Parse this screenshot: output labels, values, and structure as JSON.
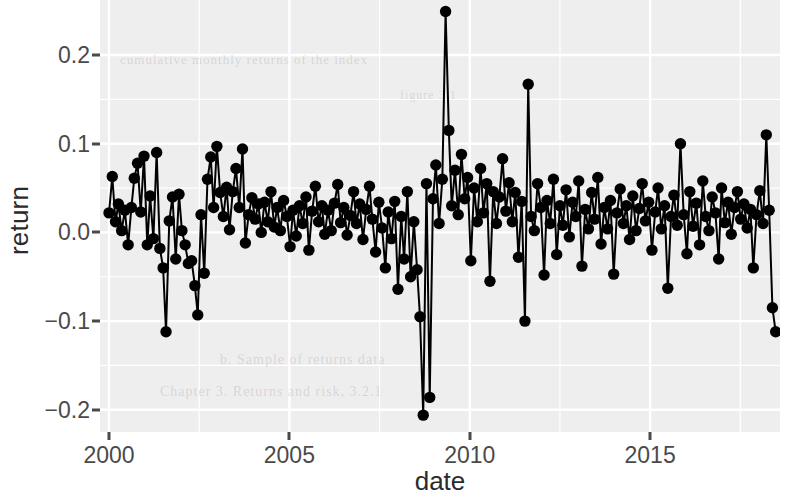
{
  "figure": {
    "background_color": "#ffffff",
    "panel_color": "#eeeeee",
    "grid_color": "#ffffff",
    "series_color": "#000000",
    "axis_text_color": "#4a4a4a",
    "axis_title_color": "#2b2b2b"
  },
  "ghost_text": [
    {
      "text": "cumulative monthly returns of the index",
      "x": 20,
      "y": 52,
      "size": 13
    },
    {
      "text": "figure 3.1",
      "x": 300,
      "y": 88,
      "size": 12
    },
    {
      "text": "b. Sample of returns data",
      "x": 120,
      "y": 352,
      "size": 14
    },
    {
      "text": "Chapter 3.  Returns and risk, 3.2.1",
      "x": 60,
      "y": 384,
      "size": 14
    }
  ],
  "chart_data": {
    "type": "line",
    "title": "",
    "subtitle": "",
    "xlabel": "date",
    "ylabel": "return",
    "grid": true,
    "legend": null,
    "markers": true,
    "marker_size": 7,
    "xlim": [
      1999.75,
      2018.6
    ],
    "ylim": [
      -0.225,
      0.262
    ],
    "xticks": [
      2000,
      2005,
      2010,
      2015
    ],
    "xticklabels": [
      "2000",
      "2005",
      "2010",
      "2015"
    ],
    "xticks_minor": [
      2002.5,
      2007.5,
      2012.5,
      2017.5
    ],
    "yticks": [
      -0.2,
      -0.1,
      0.0,
      0.1,
      0.2
    ],
    "yticklabels": [
      "-0.2",
      "-0.1",
      "0.0",
      "0.1",
      "0.2"
    ],
    "yticks_minor": [
      -0.15,
      -0.05,
      0.05,
      0.15
    ],
    "x": [
      2000.0,
      2000.33,
      2000.67,
      2001.0,
      2001.33,
      2001.67,
      2002.0,
      2002.33,
      2002.67,
      2003.0,
      2003.33,
      2003.67,
      2004.0,
      2004.33,
      2004.67,
      2005.0,
      2005.33,
      2005.67,
      2006.0,
      2006.33,
      2006.67,
      2007.0,
      2007.33,
      2007.67,
      2008.0,
      2008.33,
      2008.67,
      2009.0,
      2009.33,
      2009.67,
      2010.0,
      2010.33,
      2010.67,
      2011.0,
      2011.33,
      2011.67,
      2012.0,
      2012.33,
      2012.67,
      2013.0,
      2013.33,
      2013.67,
      2014.0,
      2014.33,
      2014.67,
      2015.0,
      2015.33,
      2015.67,
      2016.0,
      2016.33,
      2016.67,
      2017.0,
      2017.33,
      2017.67,
      2018.0,
      2018.33
    ],
    "x_full": [
      2000.0,
      2000.083,
      2000.167,
      2000.25,
      2000.333,
      2000.417,
      2000.5,
      2000.583,
      2000.667,
      2000.75,
      2000.833,
      2000.917
    ],
    "values": [
      0.022,
      0.063,
      0.012,
      0.028,
      0.002,
      0.078,
      0.086,
      0.041,
      -0.007,
      -0.018,
      -0.112,
      0.013,
      0.04,
      0.085,
      0.028,
      -0.028,
      -0.063,
      -0.002,
      -0.064,
      -0.093,
      0.003,
      0.046,
      0.094,
      0.063,
      0.018,
      0.035,
      0.096,
      0.047,
      0.012,
      0.039,
      -0.001,
      0.023,
      0.048,
      0.013,
      0.032,
      0.004,
      0.035,
      0.018,
      0.028,
      0.037,
      0.012,
      -0.047,
      0.058,
      0.002,
      0.027,
      0.013,
      0.03,
      -0.024,
      0.046,
      0.007,
      0.022,
      -0.04,
      0.047,
      0.025,
      0.074,
      0.005
    ],
    "series": [
      {
        "name": "return",
        "points": [
          [
            2000.0,
            0.022
          ],
          [
            2000.09,
            0.063
          ],
          [
            2000.18,
            0.012
          ],
          [
            2000.26,
            0.032
          ],
          [
            2000.35,
            0.002
          ],
          [
            2000.44,
            0.025
          ],
          [
            2000.53,
            -0.014
          ],
          [
            2000.62,
            0.028
          ],
          [
            2000.7,
            0.061
          ],
          [
            2000.79,
            0.078
          ],
          [
            2000.88,
            0.023
          ],
          [
            2000.97,
            0.086
          ],
          [
            2001.06,
            -0.014
          ],
          [
            2001.14,
            0.041
          ],
          [
            2001.23,
            -0.007
          ],
          [
            2001.32,
            0.09
          ],
          [
            2001.41,
            -0.018
          ],
          [
            2001.5,
            -0.04
          ],
          [
            2001.58,
            -0.112
          ],
          [
            2001.67,
            0.013
          ],
          [
            2001.76,
            0.04
          ],
          [
            2001.85,
            -0.03
          ],
          [
            2001.94,
            0.043
          ],
          [
            2002.02,
            0.002
          ],
          [
            2002.11,
            -0.014
          ],
          [
            2002.2,
            -0.035
          ],
          [
            2002.29,
            -0.032
          ],
          [
            2002.38,
            -0.06
          ],
          [
            2002.46,
            -0.093
          ],
          [
            2002.55,
            0.02
          ],
          [
            2002.64,
            -0.046
          ],
          [
            2002.73,
            0.06
          ],
          [
            2002.82,
            0.085
          ],
          [
            2002.9,
            0.028
          ],
          [
            2002.99,
            0.097
          ],
          [
            2003.08,
            0.045
          ],
          [
            2003.17,
            0.018
          ],
          [
            2003.26,
            0.051
          ],
          [
            2003.34,
            0.003
          ],
          [
            2003.43,
            0.046
          ],
          [
            2003.52,
            0.072
          ],
          [
            2003.61,
            0.028
          ],
          [
            2003.7,
            0.094
          ],
          [
            2003.78,
            -0.012
          ],
          [
            2003.87,
            0.02
          ],
          [
            2003.96,
            0.039
          ],
          [
            2004.05,
            0.015
          ],
          [
            2004.14,
            0.032
          ],
          [
            2004.22,
            0.0
          ],
          [
            2004.31,
            0.034
          ],
          [
            2004.4,
            0.012
          ],
          [
            2004.49,
            0.046
          ],
          [
            2004.58,
            0.006
          ],
          [
            2004.66,
            0.028
          ],
          [
            2004.75,
            0.002
          ],
          [
            2004.84,
            0.036
          ],
          [
            2004.93,
            0.018
          ],
          [
            2005.02,
            -0.016
          ],
          [
            2005.1,
            0.025
          ],
          [
            2005.19,
            -0.004
          ],
          [
            2005.28,
            0.03
          ],
          [
            2005.37,
            0.01
          ],
          [
            2005.46,
            0.04
          ],
          [
            2005.54,
            -0.02
          ],
          [
            2005.63,
            0.024
          ],
          [
            2005.72,
            0.052
          ],
          [
            2005.81,
            0.012
          ],
          [
            2005.9,
            0.03
          ],
          [
            2005.98,
            -0.002
          ],
          [
            2006.07,
            0.025
          ],
          [
            2006.16,
            0.002
          ],
          [
            2006.25,
            0.033
          ],
          [
            2006.34,
            0.054
          ],
          [
            2006.42,
            0.011
          ],
          [
            2006.51,
            0.028
          ],
          [
            2006.6,
            -0.003
          ],
          [
            2006.69,
            0.019
          ],
          [
            2006.78,
            0.046
          ],
          [
            2006.86,
            0.01
          ],
          [
            2006.95,
            0.032
          ],
          [
            2007.04,
            -0.008
          ],
          [
            2007.13,
            0.026
          ],
          [
            2007.22,
            0.052
          ],
          [
            2007.3,
            0.015
          ],
          [
            2007.39,
            -0.022
          ],
          [
            2007.48,
            0.034
          ],
          [
            2007.57,
            0.005
          ],
          [
            2007.66,
            -0.04
          ],
          [
            2007.74,
            0.023
          ],
          [
            2007.83,
            -0.007
          ],
          [
            2007.92,
            0.035
          ],
          [
            2008.01,
            -0.064
          ],
          [
            2008.1,
            0.018
          ],
          [
            2008.18,
            -0.03
          ],
          [
            2008.27,
            0.046
          ],
          [
            2008.36,
            -0.05
          ],
          [
            2008.45,
            0.012
          ],
          [
            2008.54,
            -0.042
          ],
          [
            2008.62,
            -0.095
          ],
          [
            2008.71,
            -0.206
          ],
          [
            2008.8,
            0.055
          ],
          [
            2008.89,
            -0.186
          ],
          [
            2008.98,
            0.038
          ],
          [
            2009.06,
            0.076
          ],
          [
            2009.15,
            0.01
          ],
          [
            2009.24,
            0.06
          ],
          [
            2009.33,
            0.249
          ],
          [
            2009.42,
            0.115
          ],
          [
            2009.5,
            0.03
          ],
          [
            2009.59,
            0.07
          ],
          [
            2009.68,
            0.02
          ],
          [
            2009.77,
            0.088
          ],
          [
            2009.86,
            0.038
          ],
          [
            2009.94,
            0.062
          ],
          [
            2010.03,
            -0.032
          ],
          [
            2010.12,
            0.05
          ],
          [
            2010.21,
            0.012
          ],
          [
            2010.3,
            0.072
          ],
          [
            2010.38,
            0.022
          ],
          [
            2010.47,
            0.055
          ],
          [
            2010.56,
            -0.055
          ],
          [
            2010.65,
            0.046
          ],
          [
            2010.74,
            0.01
          ],
          [
            2010.82,
            0.04
          ],
          [
            2010.91,
            0.083
          ],
          [
            2011.0,
            0.024
          ],
          [
            2011.09,
            0.056
          ],
          [
            2011.18,
            0.012
          ],
          [
            2011.26,
            0.045
          ],
          [
            2011.35,
            -0.028
          ],
          [
            2011.44,
            0.035
          ],
          [
            2011.53,
            -0.1
          ],
          [
            2011.62,
            0.167
          ],
          [
            2011.7,
            0.018
          ],
          [
            2011.79,
            0.002
          ],
          [
            2011.88,
            0.055
          ],
          [
            2011.97,
            0.028
          ],
          [
            2012.06,
            -0.048
          ],
          [
            2012.14,
            0.036
          ],
          [
            2012.23,
            0.01
          ],
          [
            2012.32,
            0.06
          ],
          [
            2012.41,
            -0.025
          ],
          [
            2012.5,
            0.03
          ],
          [
            2012.58,
            0.008
          ],
          [
            2012.67,
            0.048
          ],
          [
            2012.76,
            -0.005
          ],
          [
            2012.85,
            0.034
          ],
          [
            2012.94,
            0.018
          ],
          [
            2013.02,
            0.058
          ],
          [
            2013.11,
            -0.038
          ],
          [
            2013.2,
            0.026
          ],
          [
            2013.29,
            0.004
          ],
          [
            2013.38,
            0.045
          ],
          [
            2013.46,
            0.015
          ],
          [
            2013.55,
            0.062
          ],
          [
            2013.64,
            -0.013
          ],
          [
            2013.73,
            0.028
          ],
          [
            2013.82,
            0.004
          ],
          [
            2013.9,
            0.036
          ],
          [
            2013.99,
            -0.047
          ],
          [
            2014.08,
            0.022
          ],
          [
            2014.17,
            0.049
          ],
          [
            2014.26,
            0.01
          ],
          [
            2014.34,
            0.03
          ],
          [
            2014.43,
            -0.008
          ],
          [
            2014.52,
            0.041
          ],
          [
            2014.61,
            0.002
          ],
          [
            2014.7,
            0.027
          ],
          [
            2014.78,
            0.055
          ],
          [
            2014.87,
            0.013
          ],
          [
            2014.96,
            0.034
          ],
          [
            2015.05,
            -0.02
          ],
          [
            2015.14,
            0.023
          ],
          [
            2015.22,
            0.05
          ],
          [
            2015.31,
            0.004
          ],
          [
            2015.4,
            0.03
          ],
          [
            2015.49,
            -0.063
          ],
          [
            2015.58,
            0.018
          ],
          [
            2015.66,
            0.042
          ],
          [
            2015.75,
            0.008
          ],
          [
            2015.84,
            0.1
          ],
          [
            2015.93,
            0.02
          ],
          [
            2016.02,
            -0.024
          ],
          [
            2016.1,
            0.046
          ],
          [
            2016.19,
            0.007
          ],
          [
            2016.28,
            0.033
          ],
          [
            2016.37,
            -0.014
          ],
          [
            2016.46,
            0.058
          ],
          [
            2016.54,
            0.018
          ],
          [
            2016.63,
            0.002
          ],
          [
            2016.72,
            0.04
          ],
          [
            2016.81,
            0.022
          ],
          [
            2016.9,
            -0.03
          ],
          [
            2016.98,
            0.05
          ],
          [
            2017.07,
            0.011
          ],
          [
            2017.16,
            0.034
          ],
          [
            2017.25,
            -0.002
          ],
          [
            2017.34,
            0.028
          ],
          [
            2017.42,
            0.046
          ],
          [
            2017.51,
            0.015
          ],
          [
            2017.6,
            0.032
          ],
          [
            2017.69,
            0.005
          ],
          [
            2017.78,
            0.026
          ],
          [
            2017.86,
            -0.04
          ],
          [
            2017.95,
            0.02
          ],
          [
            2018.04,
            0.047
          ],
          [
            2018.13,
            0.01
          ],
          [
            2018.22,
            0.11
          ],
          [
            2018.3,
            0.025
          ],
          [
            2018.39,
            -0.085
          ],
          [
            2018.48,
            -0.112
          ]
        ]
      }
    ]
  }
}
